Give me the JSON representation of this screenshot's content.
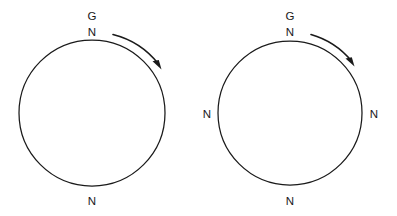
{
  "canvas": {
    "width": 397,
    "height": 216,
    "background_color": "#ffffff",
    "stroke_color": "#1a1a1a"
  },
  "figures": [
    {
      "id": "left-circle-figure",
      "name": "left-circle",
      "center": {
        "x": 92,
        "y": 113
      },
      "radius": 73,
      "labels": [
        {
          "name": "label-g-top",
          "text": "G",
          "x": 92,
          "y": 20
        },
        {
          "name": "label-n-top",
          "text": "N",
          "x": 92,
          "y": 36
        },
        {
          "name": "label-n-bottom",
          "text": "N",
          "x": 92,
          "y": 205
        }
      ],
      "arrow": {
        "name": "clockwise-rotation-arrow",
        "direction": "clockwise",
        "start": {
          "x": 113,
          "y": 35
        },
        "end": {
          "x": 159,
          "y": 66
        }
      }
    },
    {
      "id": "right-circle-figure",
      "name": "right-circle",
      "center": {
        "x": 290,
        "y": 113
      },
      "radius": 72,
      "labels": [
        {
          "name": "label-g-top",
          "text": "G",
          "x": 290,
          "y": 20
        },
        {
          "name": "label-n-top",
          "text": "N",
          "x": 290,
          "y": 36
        },
        {
          "name": "label-n-left",
          "text": "N",
          "x": 207,
          "y": 118
        },
        {
          "name": "label-n-right",
          "text": "N",
          "x": 374,
          "y": 118
        },
        {
          "name": "label-n-bottom",
          "text": "N",
          "x": 290,
          "y": 205
        }
      ],
      "arrow": {
        "name": "clockwise-rotation-arrow",
        "direction": "clockwise",
        "start": {
          "x": 311,
          "y": 35
        },
        "end": {
          "x": 353,
          "y": 63
        }
      }
    }
  ]
}
